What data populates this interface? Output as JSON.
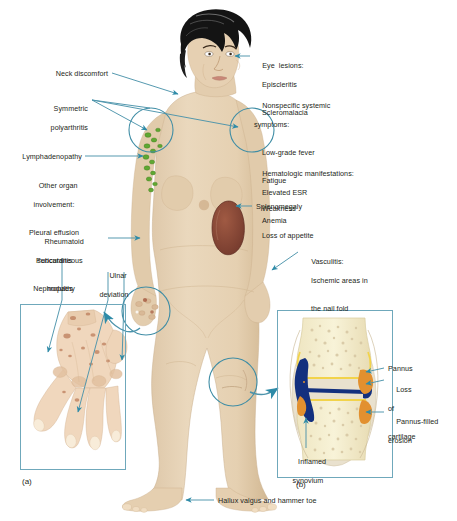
{
  "figure": {
    "title_alt": "Clinical manifestations of rheumatoid arthritis",
    "accent_teal": "#2e8ba8",
    "line_teal": "#4c93ab",
    "panel_border": "#6fa8bb",
    "text_color": "#231f20",
    "skin": "#e8d5bb",
    "skin_shadow": "#d9c2a3",
    "hair": "#1a1a1a",
    "lymph_green": "#5fa832",
    "spleen": "#8a4b3a",
    "bone": "#f6f0cf",
    "marrow_speck": "#d8c9a8",
    "synovium_navy": "#13307e",
    "pannus_orange": "#e2902f",
    "cartilage_yellow": "#f2d34a"
  },
  "labels": {
    "eye_lesions": {
      "heading": "Eye  lesions:",
      "items": [
        "Episcleritis",
        "Scleromalacia"
      ]
    },
    "nonspecific": {
      "heading_line1": "Nonspecific systemic",
      "heading_line2": "symptoms:",
      "items": [
        "Low-grade fever",
        "Fatigue",
        "Weakness",
        "Loss of appetite"
      ]
    },
    "hematologic": {
      "heading": "Hematologic manifestations:",
      "items": [
        "Elevated ESR",
        "Anemia"
      ]
    },
    "splenomegaly": "Splenomegaly",
    "vasculitis": {
      "heading": "Vasculitis:",
      "items": [
        "Ischemic areas in",
        "the nail fold"
      ]
    },
    "neck_discomfort": "Neck discomfort",
    "symmetric_polyarthritis": {
      "line1": "Symmetric",
      "line2": "polyarthritis"
    },
    "lymphadenopathy": "Lymphadenopathy",
    "other_organ": {
      "heading_line1": "Other organ",
      "heading_line2": "involvement:",
      "items": [
        "Pleural effusion",
        "Pericarditis",
        "Nephropathy"
      ]
    },
    "rheumatoid_nodules": {
      "line1": "Rheumatoid",
      "line2": "subcutaneous",
      "line3": "nodules"
    },
    "ulnar_deviation": {
      "line1": "Ulnar",
      "line2": "deviation"
    },
    "pannus": "Pannus",
    "loss_of_cartilage": {
      "line1": "Loss",
      "line2": "of",
      "line3": "cartilage"
    },
    "pannus_filled_erosion": {
      "line1": "Pannus-filled",
      "line2": "erosion"
    },
    "inflamed_synovium": {
      "line1": "Inflamed",
      "line2": "synovium"
    },
    "hallux": "Hallux valgus and hammer toe"
  },
  "panels": {
    "a_caption": "(a)",
    "b_caption": "(b)"
  }
}
